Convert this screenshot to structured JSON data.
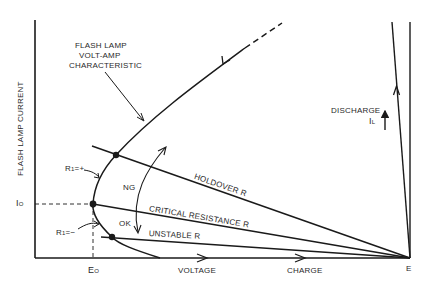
{
  "diagram": {
    "axes": {
      "y_label": "FLASH LAMP CURRENT",
      "x_label_voltage": "VOLTAGE",
      "x_label_charge": "CHARGE",
      "y_tick": "I",
      "y_tick_sub": "O",
      "x_tick_e0": "E",
      "x_tick_e0_sub": "O",
      "x_tick_e": "E"
    },
    "curve_label": [
      "FLASH LAMP",
      "VOLT-AMP",
      "CHARACTERISTIC"
    ],
    "load_lines": [
      {
        "name": "holdover",
        "label": "HOLDOVER R"
      },
      {
        "name": "critical",
        "label": "CRITICAL RESISTANCE R"
      },
      {
        "name": "unstable",
        "label": "UNSTABLE R"
      }
    ],
    "regions": {
      "ng": "NG",
      "ok": "OK"
    },
    "r1_labels": {
      "positive": {
        "main": "R",
        "sub": "1",
        "suffix": "=+"
      },
      "negative": {
        "main": "R",
        "sub": "1",
        "suffix": "=−"
      }
    },
    "discharge": {
      "label": "DISCHARGE",
      "current_main": "I",
      "current_sub": "L"
    },
    "colors": {
      "line": "#1a1a1a",
      "text": "#2a2a2a",
      "background": "#ffffff"
    }
  }
}
